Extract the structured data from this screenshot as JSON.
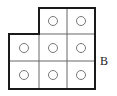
{
  "figure": {
    "label": "B",
    "shape": "L-shaped grid of 8 cells (top row 2 cells right-aligned, bottom two rows 3 cells)",
    "rows": [
      {
        "cells": [
          false,
          true,
          true
        ]
      },
      {
        "cells": [
          true,
          true,
          true
        ]
      },
      {
        "cells": [
          true,
          true,
          true
        ]
      }
    ],
    "cell_marker": "circle",
    "colors": {
      "border": "#1a1a1a",
      "grid": "#555555",
      "circle": "#777777"
    }
  }
}
